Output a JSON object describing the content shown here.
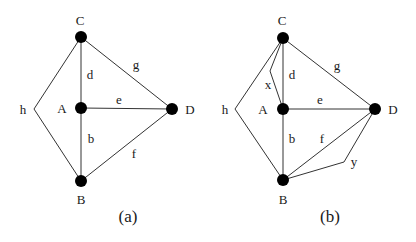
{
  "figure": {
    "panels": [
      {
        "id": "a",
        "caption": "(a)",
        "nodes": [
          {
            "name": "C",
            "label": "C"
          },
          {
            "name": "A",
            "label": "A"
          },
          {
            "name": "B",
            "label": "B"
          },
          {
            "name": "D",
            "label": "D"
          }
        ],
        "edges": [
          {
            "label": "d",
            "from": "C",
            "to": "A"
          },
          {
            "label": "b",
            "from": "A",
            "to": "B"
          },
          {
            "label": "e",
            "from": "A",
            "to": "D"
          },
          {
            "label": "g",
            "from": "C",
            "to": "D"
          },
          {
            "label": "f",
            "from": "B",
            "to": "D"
          },
          {
            "label": "h",
            "from": "C",
            "to": "B",
            "via": "bend left"
          }
        ]
      },
      {
        "id": "b",
        "caption": "(b)",
        "nodes": [
          {
            "name": "C",
            "label": "C"
          },
          {
            "name": "A",
            "label": "A"
          },
          {
            "name": "B",
            "label": "B"
          },
          {
            "name": "D",
            "label": "D"
          }
        ],
        "edges": [
          {
            "label": "d",
            "from": "C",
            "to": "A"
          },
          {
            "label": "x",
            "from": "C",
            "to": "A",
            "via": "bend left"
          },
          {
            "label": "b",
            "from": "A",
            "to": "B"
          },
          {
            "label": "e",
            "from": "A",
            "to": "D"
          },
          {
            "label": "g",
            "from": "C",
            "to": "D"
          },
          {
            "label": "f",
            "from": "B",
            "to": "D"
          },
          {
            "label": "y",
            "from": "B",
            "to": "D",
            "via": "bend right"
          },
          {
            "label": "h",
            "from": "C",
            "to": "B",
            "via": "bend left"
          }
        ]
      }
    ]
  }
}
